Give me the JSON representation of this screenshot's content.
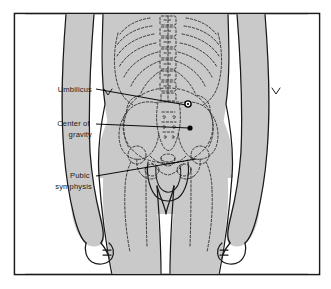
{
  "figure": {
    "frame": {
      "border_color": "#1a1a1a",
      "background_color": "#ffffff",
      "x": 14,
      "y": 13,
      "width": 306,
      "height": 262
    },
    "colors": {
      "body_fill": "#c9c9c9",
      "outline": "#1a1a1a",
      "bone_dashed": "#333333",
      "leader_line": "#000000",
      "label_text": "#1a1a1a",
      "marker_fill": "#000000"
    }
  },
  "labels": [
    {
      "id": "umbilicus",
      "lines": [
        "Umbilicus"
      ],
      "text_x": 92,
      "text_y": 92,
      "leader": {
        "from_x": 96,
        "from_y": 89,
        "to_x": 186,
        "to_y": 105
      },
      "marker": {
        "type": "ring",
        "x": 188,
        "y": 104,
        "r": 3.1
      }
    },
    {
      "id": "center-of-gravity",
      "lines": [
        "Center of",
        "gravity"
      ],
      "text_x": 92,
      "text_y": 126,
      "leader": {
        "from_x": 96,
        "from_y": 124,
        "to_x": 189,
        "to_y": 128
      },
      "marker": {
        "type": "dot",
        "x": 190,
        "y": 128,
        "r": 2.6
      }
    },
    {
      "id": "pubic-symphysis",
      "lines": [
        "Pubic",
        "symphysis"
      ],
      "text_x": 92,
      "text_y": 178,
      "leader": {
        "from_x": 96,
        "from_y": 176,
        "to_x": 196,
        "to_y": 159
      },
      "marker": {
        "type": "none",
        "x": 196,
        "y": 159,
        "r": 0
      }
    }
  ],
  "anatomy": {
    "regions": [
      "rib-cage-left",
      "rib-cage-right",
      "lumbar-spine",
      "sacrum",
      "ilium-left",
      "ilium-right",
      "femoral-head-left",
      "femoral-head-right",
      "pubic-arch",
      "left-arm",
      "right-arm",
      "left-hand",
      "right-hand",
      "torso-outline",
      "legs-outline",
      "navel-crease"
    ]
  }
}
